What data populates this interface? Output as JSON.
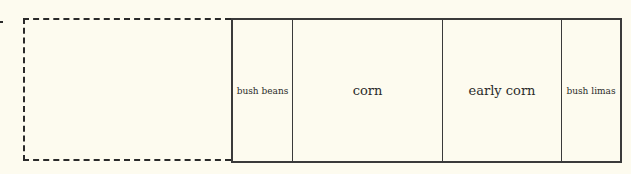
{
  "diagram": {
    "type": "garden-plot-layout",
    "empty_area": {
      "style": "dashed",
      "label": ""
    },
    "beds": [
      {
        "label": "bush beans"
      },
      {
        "label": "corn"
      },
      {
        "label": "early corn"
      },
      {
        "label": "bush limas"
      }
    ]
  }
}
